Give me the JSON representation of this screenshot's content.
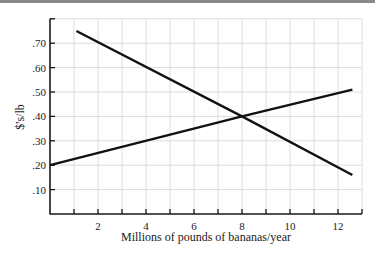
{
  "chart_data": {
    "type": "line",
    "title": "",
    "xlabel": "Millions of pounds of bananas/year",
    "ylabel": "$'s/lb",
    "xlim": [
      0,
      13
    ],
    "ylim": [
      0,
      0.8
    ],
    "grid": true,
    "legend": null,
    "x_ticks": [
      2,
      4,
      6,
      8,
      10,
      12
    ],
    "x_tick_labels": [
      "2",
      "4",
      "6",
      "8",
      "10",
      "12"
    ],
    "y_ticks": [
      0.1,
      0.2,
      0.3,
      0.4,
      0.5,
      0.6,
      0.7
    ],
    "y_tick_labels": [
      ".10",
      ".20",
      ".30",
      ".40",
      ".50",
      ".60",
      ".70"
    ],
    "series": [
      {
        "name": "downward-sloping line",
        "x": [
          1.1,
          8,
          12.6
        ],
        "values": [
          0.75,
          0.4,
          0.16
        ]
      },
      {
        "name": "upward-sloping line",
        "x": [
          0,
          8,
          12.6
        ],
        "values": [
          0.2,
          0.4,
          0.51
        ]
      }
    ],
    "annotations": [
      {
        "type": "intersection",
        "x": 8,
        "y": 0.4
      }
    ]
  },
  "colors": {
    "line": "#111111",
    "axis": "#1a1a1a",
    "grid": "#dcdcdc",
    "top_bar": "#8a8a8a"
  }
}
